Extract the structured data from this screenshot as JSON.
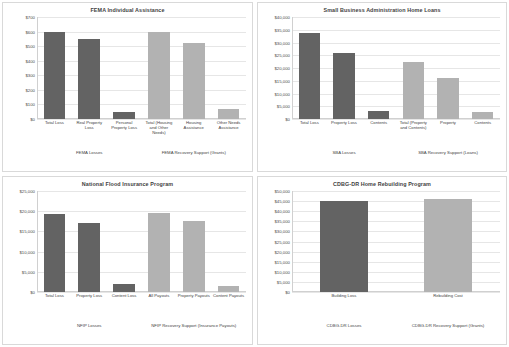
{
  "figure": {
    "panel_count": 4,
    "colors": {
      "loss_bar": "#636363",
      "recovery_bar": "#b2b2b2",
      "grid": "#e6e6e6",
      "text": "#3f3f3f"
    }
  },
  "chart_data": [
    {
      "type": "bar",
      "title": "FEMA Individual Assistance",
      "xlabel": "",
      "ylabel": "",
      "ylim": [
        0,
        700
      ],
      "ytick_labels": [
        "$700",
        "$600",
        "$500",
        "$400",
        "$300",
        "$200",
        "$100",
        "$0"
      ],
      "yticks": [
        700,
        600,
        500,
        400,
        300,
        200,
        100,
        0
      ],
      "grid": true,
      "categories": [
        "Total Loss",
        "Real Property Loss",
        "Personal Property Loss",
        "Total (Housing and Other Needs)",
        "Housing Assistance",
        "Other Needs Assistance"
      ],
      "values": [
        600,
        550,
        50,
        595,
        520,
        70
      ],
      "bar_styles": [
        "dark",
        "dark",
        "dark",
        "light",
        "light",
        "light"
      ],
      "groups": [
        {
          "label": "FEMA Losses",
          "span": 3
        },
        {
          "label": "FEMA Recovery Support (Grants)",
          "span": 3
        }
      ]
    },
    {
      "type": "bar",
      "title": "Small Business Administration Home Loans",
      "xlabel": "",
      "ylabel": "",
      "ylim": [
        0,
        40000
      ],
      "ytick_labels": [
        "$40,000",
        "$35,000",
        "$30,000",
        "$25,000",
        "$20,000",
        "$15,000",
        "$10,000",
        "$5,000",
        "$0"
      ],
      "yticks": [
        40000,
        35000,
        30000,
        25000,
        20000,
        15000,
        10000,
        5000,
        0
      ],
      "grid": true,
      "categories": [
        "Total Loss",
        "Property Loss",
        "Contents",
        "Total (Property and Contents)",
        "Property",
        "Contents"
      ],
      "values": [
        33800,
        25800,
        3000,
        22500,
        16200,
        2800
      ],
      "bar_styles": [
        "dark",
        "dark",
        "dark",
        "light",
        "light",
        "light"
      ],
      "groups": [
        {
          "label": "SBA Losses",
          "span": 3
        },
        {
          "label": "SBA Recovery Support (Loans)",
          "span": 3
        }
      ]
    },
    {
      "type": "bar",
      "title": "National Flood Insurance Program",
      "xlabel": "",
      "ylabel": "",
      "ylim": [
        0,
        25000
      ],
      "ytick_labels": [
        "$25,000",
        "$20,000",
        "$15,000",
        "$10,000",
        "$5,000",
        "$0"
      ],
      "yticks": [
        25000,
        20000,
        15000,
        10000,
        5000,
        0
      ],
      "grid": true,
      "categories": [
        "Total Loss",
        "Property Loss",
        "Content Loss",
        "All Payouts",
        "Property Payouts",
        "Content Payouts"
      ],
      "values": [
        19400,
        17100,
        2100,
        19500,
        17700,
        1500
      ],
      "bar_styles": [
        "dark",
        "dark",
        "dark",
        "light",
        "light",
        "light"
      ],
      "groups": [
        {
          "label": "NFIP Losses",
          "span": 3
        },
        {
          "label": "NFIP Recovery Support (Insurance Payouts)",
          "span": 3
        }
      ]
    },
    {
      "type": "bar",
      "title": "CDBG-DR Home Rebuilding Program",
      "xlabel": "",
      "ylabel": "",
      "ylim": [
        0,
        50000
      ],
      "ytick_labels": [
        "$50,000",
        "$45,000",
        "$40,000",
        "$35,000",
        "$30,000",
        "$25,000",
        "$20,000",
        "$15,000",
        "$10,000",
        "$5,000",
        "$0"
      ],
      "yticks": [
        50000,
        45000,
        40000,
        35000,
        30000,
        25000,
        20000,
        15000,
        10000,
        5000,
        0
      ],
      "grid": true,
      "categories": [
        "Building Loss",
        "Rebuilding Cost"
      ],
      "values": [
        45000,
        45800
      ],
      "bar_styles": [
        "dark",
        "light"
      ],
      "groups": [
        {
          "label": "CDBG-DR Losses",
          "span": 1
        },
        {
          "label": "CDBG-DR Recovery Support (Grants)",
          "span": 1
        }
      ]
    }
  ]
}
